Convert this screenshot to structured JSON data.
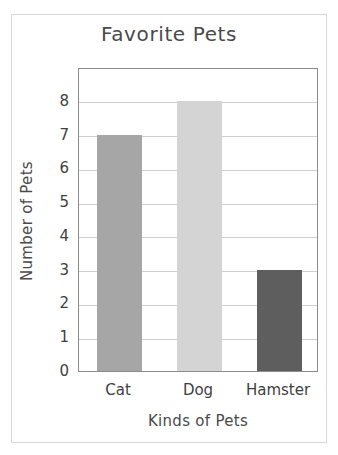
{
  "figure": {
    "frame_color": "#d8d8d8",
    "background": "#ffffff",
    "plot_border_color": "#8c8c8c",
    "gridline_color": "#cfcfcf",
    "text_color": "#4a4a4a"
  },
  "chart_data": {
    "type": "bar",
    "title": "Favorite Pets",
    "xlabel": "Kinds of Pets",
    "ylabel": "Number of Pets",
    "categories": [
      "Cat",
      "Dog",
      "Hamster"
    ],
    "values": [
      7,
      8,
      3
    ],
    "bar_colors": [
      "#a6a6a6",
      "#d4d4d4",
      "#5e5e5e"
    ],
    "ylim": [
      0,
      9
    ],
    "yticks": [
      0,
      1,
      2,
      3,
      4,
      5,
      6,
      7,
      8
    ],
    "ytick_labels": [
      "0",
      "1",
      "2",
      "3",
      "4",
      "5",
      "6",
      "7",
      "8"
    ],
    "grid": true,
    "grid_axis": "y",
    "legend": false,
    "legend_position": "none",
    "series": [
      {
        "name": "Number of Pets",
        "values": [
          7,
          8,
          3
        ]
      }
    ],
    "annotations": []
  }
}
